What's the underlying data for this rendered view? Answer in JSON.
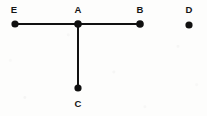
{
  "figure": {
    "background_color": "#fdfdfc",
    "ink_color": "#111111",
    "canvas": {
      "width": 207,
      "height": 116
    },
    "points": [
      {
        "id": "E",
        "label": "E",
        "x": 15,
        "y": 24,
        "radius": 3.6,
        "label_x": 14,
        "label_y": 13,
        "label_position": "above"
      },
      {
        "id": "A",
        "label": "A",
        "x": 78,
        "y": 24,
        "radius": 3.8,
        "label_x": 78,
        "label_y": 13,
        "label_position": "above"
      },
      {
        "id": "B",
        "label": "B",
        "x": 140,
        "y": 24,
        "radius": 3.8,
        "label_x": 140,
        "label_y": 13,
        "label_position": "above"
      },
      {
        "id": "D",
        "label": "D",
        "x": 189,
        "y": 25,
        "radius": 3.6,
        "label_x": 189,
        "label_y": 13,
        "label_position": "above"
      },
      {
        "id": "C",
        "label": "C",
        "x": 78,
        "y": 88,
        "radius": 3.6,
        "label_x": 78,
        "label_y": 107,
        "label_position": "below"
      }
    ],
    "segments": [
      {
        "id": "EA",
        "from": "E",
        "to": "A",
        "x1": 15,
        "y1": 24,
        "x2": 78,
        "y2": 24,
        "width": 2
      },
      {
        "id": "AB",
        "from": "A",
        "to": "B",
        "x1": 78,
        "y1": 24,
        "x2": 140,
        "y2": 24,
        "width": 2
      },
      {
        "id": "AC",
        "from": "A",
        "to": "C",
        "x1": 78,
        "y1": 24,
        "x2": 78,
        "y2": 88,
        "width": 2
      }
    ],
    "isolated_points": [
      "D"
    ]
  }
}
